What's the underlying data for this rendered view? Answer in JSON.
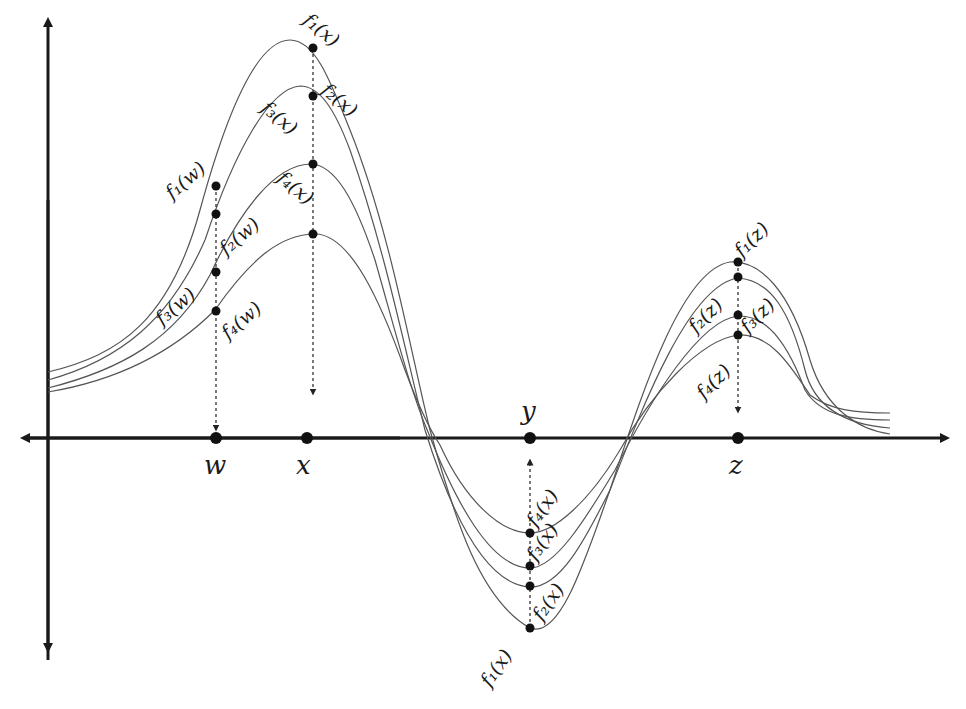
{
  "diagram": {
    "title": "",
    "colors": {
      "axis": "#1a1a1a",
      "curve": "#555555",
      "point": "#111111"
    },
    "x_points": [
      {
        "id": "w",
        "label": "w"
      },
      {
        "id": "x",
        "label": "x"
      },
      {
        "id": "y",
        "label": "y"
      },
      {
        "id": "z",
        "label": "z"
      }
    ],
    "functions": [
      "f1",
      "f2",
      "f3",
      "f4"
    ],
    "point_labels": {
      "w": [
        "f₁(w)",
        "f₂(w)",
        "f₃(w)",
        "f₄(w)"
      ],
      "x_top": [
        "f₁(x)",
        "f₂(x)",
        "f₃(x)",
        "f₄(x)"
      ],
      "y_bottom": [
        "f₁(x)",
        "f₂(x)",
        "f₃(x)",
        "f₄(x)"
      ],
      "z": [
        "f₁(z)",
        "f₂(z)",
        "f₃(z)",
        "f₄(z)"
      ]
    },
    "relative_values": {
      "note": "approximate function values at marked points (y-axis units, x-axis = 0)",
      "w": [
        1.3,
        1.25,
        1.02,
        0.9
      ],
      "x": [
        2.25,
        2.0,
        1.6,
        1.25
      ],
      "y": [
        -1.15,
        -0.9,
        -0.8,
        -0.55
      ],
      "z": [
        1.05,
        1.0,
        0.7,
        0.6
      ]
    }
  }
}
